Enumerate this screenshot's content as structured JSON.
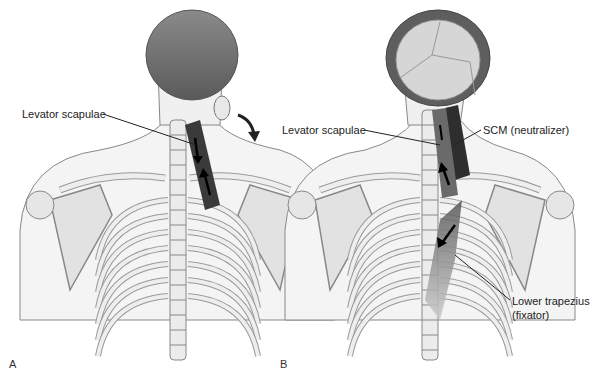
{
  "panels": [
    {
      "id": "A",
      "letter": "A",
      "labels": [
        {
          "text": "Levator scapulae"
        }
      ],
      "arrows": [
        "downward-arrow",
        "upward-arrow",
        "curved-rotation-arrow"
      ]
    },
    {
      "id": "B",
      "letter": "B",
      "labels": [
        {
          "text": "Levator scapulae"
        },
        {
          "text": "SCM (neutralizer)"
        },
        {
          "text": "Lower trapezius"
        },
        {
          "text": "(fixator)"
        }
      ],
      "arrows": [
        "upward-arrow",
        "downward-arrow",
        "diagonal-arrow"
      ]
    }
  ],
  "colors": {
    "muscle": "#3a3a3a",
    "muscle_light": "#6a6a6a",
    "bone": "#e8e8e8",
    "bone_outline": "#8a8a8a",
    "skin": "#f0f0f0",
    "hair": "#6e6e6e",
    "skull": "#d4d4d4"
  }
}
